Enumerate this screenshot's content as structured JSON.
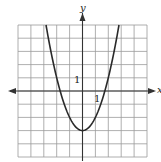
{
  "chart_data": {
    "type": "line",
    "title": "",
    "xlabel": "x",
    "ylabel": "y",
    "function": "y = x^2 - 3",
    "xlim": [
      -5,
      5
    ],
    "ylim": [
      -5,
      5
    ],
    "grid": true,
    "grid_step": 1,
    "tick_labels": [
      {
        "axis": "y",
        "value": 1,
        "text": "1"
      },
      {
        "axis": "x",
        "value": 1,
        "text": "1"
      }
    ],
    "vertex": [
      0,
      -3
    ],
    "series": [
      {
        "name": "parabola",
        "x": [
          -2.83,
          -2.5,
          -2,
          -1.5,
          -1.73,
          -1,
          -0.5,
          0,
          0.5,
          1,
          1.5,
          1.73,
          2,
          2.5,
          2.83
        ],
        "y": [
          5,
          3.25,
          1,
          -0.75,
          0,
          -2,
          -2.75,
          -3,
          -2.75,
          -2,
          -0.75,
          0,
          1,
          3.25,
          5
        ]
      }
    ]
  },
  "labels": {
    "x_axis": "x",
    "y_axis": "y",
    "y_tick_one": "1",
    "x_tick_one": "1"
  },
  "colors": {
    "grid": "#9a9a9a",
    "axis": "#333333",
    "curve": "#2a2a2a"
  }
}
